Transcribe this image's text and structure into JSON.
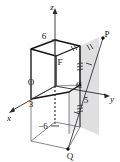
{
  "figure": {
    "type": "3d-coordinate-geometry-diagram",
    "background_color": "#ffffff",
    "line_color": "#1a1a1a",
    "shade_color": "#d8d8d8",
    "axes": [
      {
        "name": "x",
        "label": "x",
        "x": 9,
        "y": 118
      },
      {
        "name": "y",
        "label": "y",
        "x": 112,
        "y": 99
      },
      {
        "name": "z",
        "label": "z",
        "x": 52,
        "y": 7
      }
    ],
    "tick_labels": [
      {
        "name": "z-tick-6",
        "label": "6",
        "x": 44,
        "y": 36
      },
      {
        "name": "x-tick-3",
        "label": "3",
        "x": 31,
        "y": 104
      },
      {
        "name": "y-tick-5",
        "label": "5",
        "x": 86,
        "y": 100
      },
      {
        "name": "z-tick-minus-6",
        "label": "−6",
        "x": 43,
        "y": 126
      }
    ],
    "points": [
      {
        "name": "point-O",
        "label": "O",
        "x": 31,
        "y": 82
      },
      {
        "name": "point-F",
        "label": "F",
        "x": 60,
        "y": 62
      },
      {
        "name": "point-C",
        "label": "C",
        "x": 79,
        "y": 85
      },
      {
        "name": "point-P",
        "label": "P",
        "x": 107,
        "y": 34
      },
      {
        "name": "point-Q",
        "label": "Q",
        "x": 70,
        "y": 156
      }
    ],
    "segments": {
      "upper_cube": "solid bold cube from z=0 to z=6",
      "lower_box": "thin/dashed box from z=0 to z=-6",
      "shaded_plane": "light gray quadrilateral on the y=5 side",
      "line_PQ": "diagonal from P down to Q with single tick",
      "vertical_PC_CQ": "vertical segment through C with triple ticks"
    }
  }
}
